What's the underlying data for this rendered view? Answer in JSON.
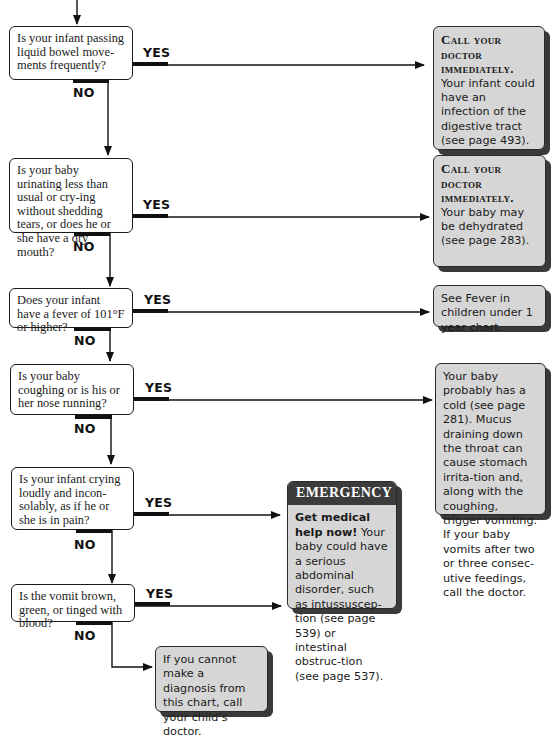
{
  "flowchart": {
    "labels": {
      "yes": "YES",
      "no": "NO"
    },
    "questions": [
      {
        "id": "q1",
        "text": "Is your infant passing liquid bowel move-ments frequently?"
      },
      {
        "id": "q2",
        "text": "Is your baby urinating less than usual or cry-ing without shedding tears, or does he or she have a dry mouth?"
      },
      {
        "id": "q3",
        "text": "Does your infant have a fever of 101°F or higher?"
      },
      {
        "id": "q4",
        "text": "Is your baby coughing or is his or her nose running?"
      },
      {
        "id": "q5",
        "text": "Is your infant crying loudly and incon-solably, as if he or she is in pain?"
      },
      {
        "id": "q6",
        "text": "Is the vomit brown, green, or tinged with blood?"
      }
    ],
    "answers": [
      {
        "id": "a1",
        "heading": "Call your doctor immediately.",
        "text": "Your infant could have an infection of the digestive tract (see page 493)."
      },
      {
        "id": "a2",
        "heading": "Call your doctor immediately.",
        "text": "Your baby may be dehydrated (see page 283)."
      },
      {
        "id": "a3",
        "text": "See Fever in children under 1 year chart."
      },
      {
        "id": "a4",
        "text": "Your baby probably has a cold (see page 281). Mucus draining down the throat can cause stomach irrita-tion and, along with the coughing, trigger vomiting. If your baby vomits after two or three consec-utive feedings, call the doctor."
      },
      {
        "id": "a5",
        "heading": "EMERGENCY",
        "bold_lead": "Get medical help now!",
        "text": " Your baby could have a serious abdominal disorder, such as intussuscep-tion (see page 539) or intestinal obstruc-tion (see page 537)."
      },
      {
        "id": "a6",
        "text": "If you cannot make a diagnosis from this chart, call your child’s doctor."
      }
    ]
  }
}
